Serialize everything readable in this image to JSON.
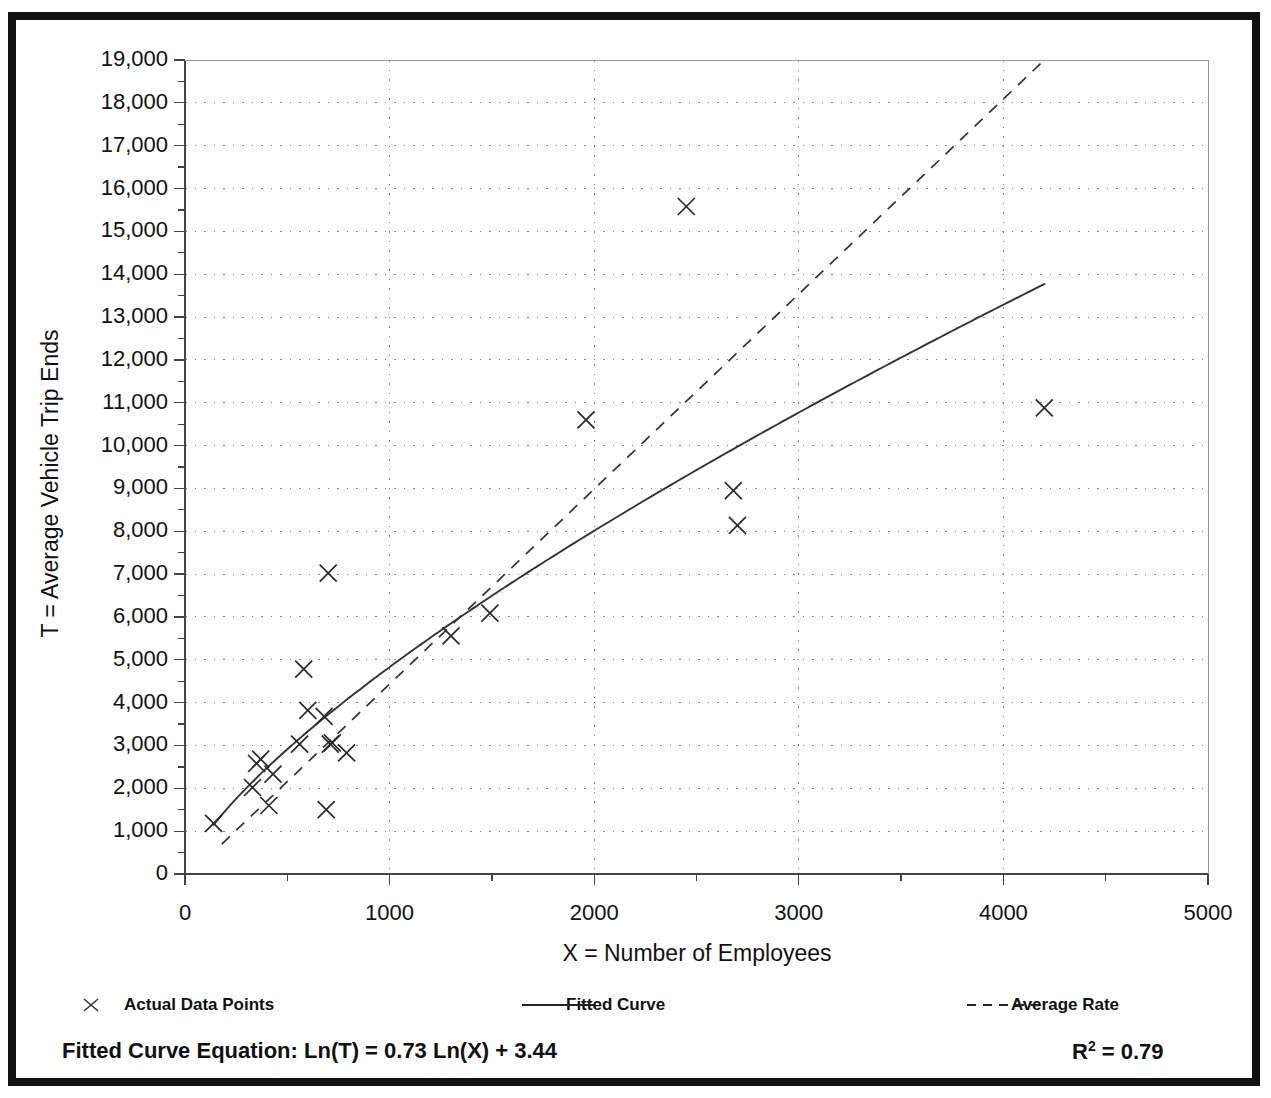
{
  "figure": {
    "top_title_fragment": "",
    "background": "#ffffff",
    "frame_color": "#111111"
  },
  "axes": {
    "x_label": "X = Number of Employees",
    "y_label": "T = Average Vehicle Trip Ends",
    "x_ticks": [
      "0",
      "1000",
      "2000",
      "3000",
      "4000",
      "5000"
    ],
    "y_ticks": [
      "0",
      "1,000",
      "2,000",
      "3,000",
      "4,000",
      "5,000",
      "6,000",
      "7,000",
      "8,000",
      "9,000",
      "10,000",
      "11,000",
      "12,000",
      "13,000",
      "14,000",
      "15,000",
      "16,000",
      "17,000",
      "18,000",
      "19,000"
    ]
  },
  "legend": {
    "items": [
      {
        "label": "Actual Data Points",
        "marker": "cross-marker-icon",
        "color": "#222222"
      },
      {
        "label": "Fitted Curve",
        "marker": "solid-line-icon",
        "color": "#222222"
      },
      {
        "label": "Average Rate",
        "marker": "dashed-line-icon",
        "color": "#222222"
      }
    ]
  },
  "annotations": {
    "equation": "Fitted Curve Equation:  Ln(T) = 0.73 Ln(X) + 3.44",
    "r_squared_label": "R",
    "r_squared_exp": "2",
    "r_squared_value": " = 0.79"
  },
  "chart_data": {
    "type": "scatter",
    "title": "",
    "xlabel": "X = Number of Employees",
    "ylabel": "T = Average Vehicle Trip Ends",
    "xlim": [
      0,
      5000
    ],
    "ylim": [
      0,
      19000
    ],
    "x_major_step": 1000,
    "x_minor_step": 500,
    "y_major_step": 1000,
    "y_minor_step": 500,
    "grid": true,
    "grid_style": "dotted",
    "legend_position": "below-axes",
    "series": [
      {
        "name": "Actual Data Points",
        "type": "scatter",
        "marker": "x",
        "points": [
          [
            140,
            1180
          ],
          [
            330,
            2020
          ],
          [
            350,
            2580
          ],
          [
            370,
            2680
          ],
          [
            410,
            1600
          ],
          [
            430,
            2330
          ],
          [
            560,
            3030
          ],
          [
            580,
            4780
          ],
          [
            600,
            3820
          ],
          [
            680,
            3680
          ],
          [
            690,
            1500
          ],
          [
            700,
            7020
          ],
          [
            710,
            3030
          ],
          [
            720,
            3060
          ],
          [
            790,
            2830
          ],
          [
            1300,
            5560
          ],
          [
            1490,
            6090
          ],
          [
            1960,
            10600
          ],
          [
            2450,
            15580
          ],
          [
            2680,
            8950
          ],
          [
            2700,
            8140
          ],
          [
            4200,
            10880
          ]
        ]
      },
      {
        "name": "Fitted Curve",
        "type": "line",
        "style": "solid",
        "equation": "Ln(T) = 0.73 Ln(X) + 3.44",
        "slope": 0.73,
        "intercept": 3.44,
        "r_squared": 0.79,
        "x_range": [
          140,
          4200
        ]
      },
      {
        "name": "Average Rate",
        "type": "line",
        "style": "dashed",
        "points": [
          [
            180,
            700
          ],
          [
            4200,
            19000
          ]
        ],
        "rate_per_employee": 4.55
      }
    ]
  }
}
